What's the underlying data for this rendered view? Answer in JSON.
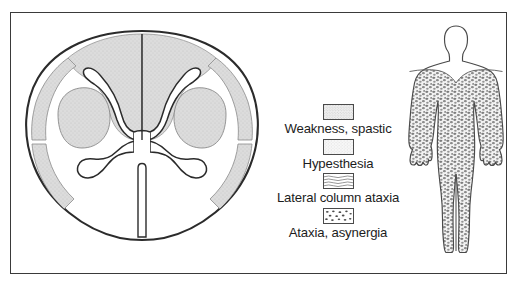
{
  "figure": {
    "border_color": "#3a3a3a",
    "background": "#ffffff"
  },
  "colors": {
    "outline": "#2b2b2b",
    "shade_gray": "#d8d8d8",
    "shade_gray_light": "#e3e3e3",
    "text": "#1c1c1c",
    "swatch_border": "#4a4a4a"
  },
  "cord_diagram": {
    "name": "spinal-cord-cross-section",
    "regions": [
      {
        "label": "posterior-columns",
        "fill": "#dcdcdc",
        "pattern": "stipple"
      },
      {
        "label": "lateral-corticospinal-tract-left",
        "fill": "#dcdcdc",
        "pattern": "stipple"
      },
      {
        "label": "lateral-corticospinal-tract-right",
        "fill": "#dcdcdc",
        "pattern": "stipple"
      },
      {
        "label": "lateral-margin-strip-left",
        "fill": "#dcdcdc",
        "pattern": "stipple"
      },
      {
        "label": "lateral-margin-strip-right",
        "fill": "#dcdcdc",
        "pattern": "stipple"
      },
      {
        "label": "gray-matter-butterfly",
        "fill": "#ffffff",
        "pattern": "none"
      }
    ]
  },
  "legend": {
    "name": "symptom-legend",
    "entries": [
      {
        "label": "Weakness, spastic",
        "pattern": "fine-stipple",
        "swatch_name": "swatch-weakness-spastic"
      },
      {
        "label": "Hypesthesia",
        "pattern": "light-stipple",
        "swatch_name": "swatch-hypesthesia"
      },
      {
        "label": "Lateral column ataxia",
        "pattern": "wavy-lines",
        "swatch_name": "swatch-lateral-column-ataxia"
      },
      {
        "label": "Ataxia, asynergia",
        "pattern": "coarse-speckle",
        "swatch_name": "swatch-ataxia-asynergia"
      }
    ]
  },
  "body_figure": {
    "name": "human-body-figure",
    "view": "anterior",
    "shaded_pattern": "coarse-speckle",
    "unshaded_regions": [
      "head",
      "neck",
      "upper-shoulders"
    ],
    "shaded_regions": [
      "chest",
      "abdomen",
      "arms",
      "hands",
      "legs",
      "feet"
    ]
  }
}
